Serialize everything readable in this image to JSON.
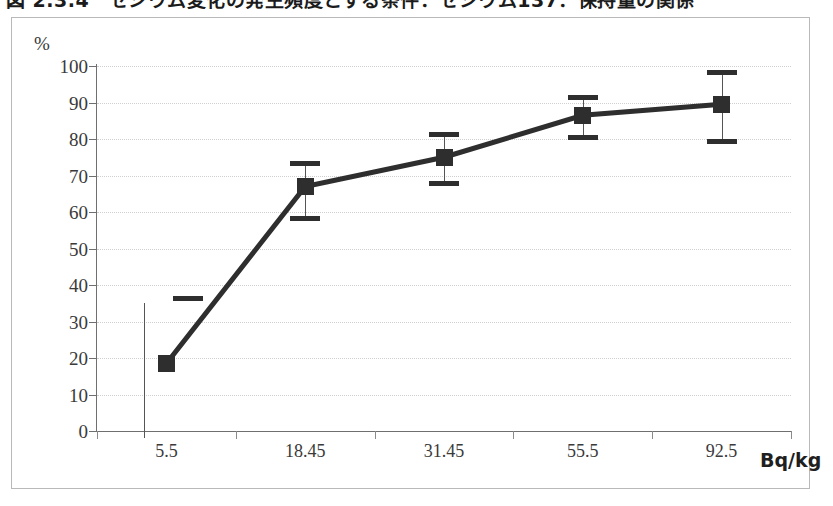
{
  "caption": {
    "text": "図 2.3.4　セシウム変化の発生頻度とする条件：セシウム137：保持量の関係"
  },
  "axes": {
    "y_unit": "%",
    "x_unit": "Bq/kg",
    "y_ticks": [
      0,
      10,
      20,
      30,
      40,
      50,
      60,
      70,
      80,
      90,
      100
    ],
    "x_categories": [
      "5.5",
      "18.45",
      "31.45",
      "55.5",
      "92.5"
    ]
  },
  "chart_data": {
    "type": "line",
    "title": "図 2.3.4　セシウム変化の発生頻度とする条件：セシウム137：保持量の関係",
    "xlabel": "Bq/kg",
    "ylabel": "%",
    "ylim": [
      0,
      100
    ],
    "grid": true,
    "legend": "none",
    "categories": [
      "5.5",
      "18.45",
      "31.45",
      "55.5",
      "92.5"
    ],
    "values": [
      18.5,
      67.0,
      75.0,
      86.5,
      89.5
    ],
    "error_bars": [
      {
        "category": "5.5",
        "value": 18.5,
        "upper": 37.0,
        "lower": 0.0
      },
      {
        "category": "18.45",
        "value": 67.0,
        "upper": 74.0,
        "lower": 59.0
      },
      {
        "category": "31.45",
        "value": 75.0,
        "upper": 82.0,
        "lower": 68.5
      },
      {
        "category": "55.5",
        "value": 86.5,
        "upper": 92.0,
        "lower": 81.0
      },
      {
        "category": "92.5",
        "value": 89.5,
        "upper": 99.0,
        "lower": 80.0
      }
    ],
    "marker": "square",
    "line_color": "#2e2e2e"
  },
  "style": {
    "line_color": "#2e2e2e",
    "grid_color": "#cfcfcf",
    "axis_color": "#6f6f6f",
    "frame_color": "#b9b9b9",
    "background": "#ffffff"
  }
}
